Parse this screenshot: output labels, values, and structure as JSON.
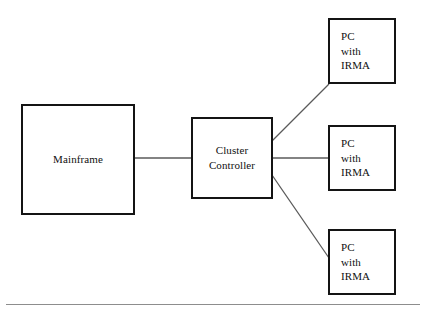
{
  "diagram": {
    "type": "network-topology",
    "colors": {
      "node_border": "#141414",
      "node_fill": "#ffffff",
      "connector": "#5a5a5a",
      "text": "#101010",
      "rule": "#8d8d8d",
      "background": "#ffffff"
    },
    "nodes": [
      {
        "id": "mainframe",
        "label": "Mainframe",
        "shape": "rectangle",
        "align": "center",
        "x": 21,
        "y": 104,
        "width": 114,
        "height": 111
      },
      {
        "id": "cluster-controller",
        "label": "Cluster\nController",
        "shape": "rectangle",
        "align": "center",
        "x": 191,
        "y": 117,
        "width": 82,
        "height": 82
      },
      {
        "id": "pc-irma-1",
        "label": "PC\nwith\nIRMA",
        "shape": "rectangle",
        "align": "left",
        "x": 328,
        "y": 18,
        "width": 68,
        "height": 66
      },
      {
        "id": "pc-irma-2",
        "label": "PC\nwith\nIRMA",
        "shape": "rectangle",
        "align": "left",
        "x": 328,
        "y": 125,
        "width": 68,
        "height": 66
      },
      {
        "id": "pc-irma-3",
        "label": "PC\nwith\nIRMA",
        "shape": "rectangle",
        "align": "left",
        "x": 328,
        "y": 229,
        "width": 68,
        "height": 66
      }
    ],
    "connectors": [
      {
        "id": "mainframe-to-cluster",
        "from": "mainframe",
        "to": "cluster-controller",
        "kind": "horizontal",
        "x1": 134,
        "y1": 158,
        "x2": 192,
        "y2": 158
      },
      {
        "id": "cluster-to-pc-1",
        "from": "cluster-controller",
        "to": "pc-irma-1",
        "kind": "diagonal",
        "x1": 272,
        "y1": 141,
        "x2": 329,
        "y2": 84
      },
      {
        "id": "cluster-to-pc-2",
        "from": "cluster-controller",
        "to": "pc-irma-2",
        "kind": "horizontal",
        "x1": 272,
        "y1": 158,
        "x2": 329,
        "y2": 158
      },
      {
        "id": "cluster-to-pc-3",
        "from": "cluster-controller",
        "to": "pc-irma-3",
        "kind": "diagonal",
        "x1": 272,
        "y1": 175,
        "x2": 329,
        "y2": 258
      }
    ],
    "footer_rule": {
      "x": 6,
      "y": 304,
      "width": 414
    }
  }
}
